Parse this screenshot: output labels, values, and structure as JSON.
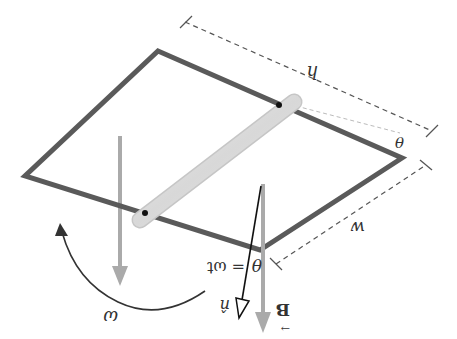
{
  "diagram": {
    "orientation": "rotated-180",
    "labels": {
      "height": "h",
      "width": "w",
      "angle_corner": "θ",
      "angle_normal": "θ",
      "theta_eq": "= ωt",
      "omega": "ω",
      "normal": "n̂",
      "field": "B",
      "field_arrow": "→"
    },
    "colors": {
      "loop": "#5a5a5a",
      "field_arrow": "#aaaaaa",
      "rod": "#dcdcdc",
      "rod_edge": "#c4c4c4",
      "dimension": "#555555",
      "text": "#333333",
      "normal_vector": "#111111"
    }
  }
}
